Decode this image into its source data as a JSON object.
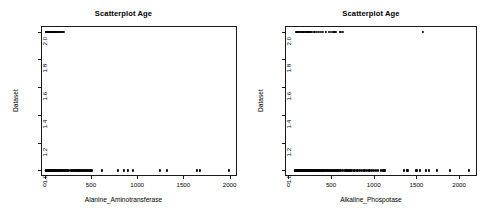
{
  "figure": {
    "background": "#ffffff",
    "point_color": "#000000",
    "axis_color": "#1a1a1a"
  },
  "chart_data": [
    {
      "type": "scatter",
      "title": "Scatterplot Age",
      "xlabel": "Alanine_Aminotransferase",
      "ylabel": "Dataset",
      "xlim": [
        -40,
        2080
      ],
      "ylim": [
        0.96,
        2.04
      ],
      "grid": false,
      "legend": "none",
      "xticks": [
        0,
        500,
        1000,
        1500,
        2000
      ],
      "xtick_labels": [
        "0",
        "500",
        "1000",
        "1500",
        "2000"
      ],
      "yticks": [
        1.0,
        1.2,
        1.4,
        1.6,
        1.8,
        2.0
      ],
      "ytick_labels": [
        "1.0",
        "1.2",
        "1.4",
        "1.6",
        "1.8",
        "2.0"
      ],
      "series": [
        {
          "name": "Dataset 2",
          "y": 2.0,
          "x": [
            10,
            14,
            16,
            18,
            20,
            22,
            24,
            26,
            28,
            30,
            32,
            34,
            36,
            38,
            40,
            42,
            45,
            48,
            50,
            52,
            55,
            58,
            60,
            62,
            65,
            68,
            70,
            72,
            75,
            78,
            80,
            85,
            90,
            95,
            100,
            105,
            110,
            118,
            125,
            132,
            140,
            150,
            160,
            172,
            185,
            200,
            212
          ]
        },
        {
          "name": "Dataset 1",
          "y": 1.0,
          "x": [
            10,
            12,
            14,
            16,
            18,
            20,
            22,
            24,
            26,
            28,
            30,
            32,
            34,
            36,
            38,
            40,
            42,
            44,
            46,
            48,
            50,
            52,
            55,
            58,
            60,
            62,
            64,
            66,
            68,
            70,
            73,
            76,
            80,
            84,
            88,
            92,
            96,
            100,
            105,
            110,
            115,
            120,
            126,
            132,
            138,
            145,
            152,
            160,
            168,
            176,
            185,
            195,
            205,
            215,
            228,
            240,
            252,
            265,
            285,
            295,
            305,
            315,
            325,
            335,
            345,
            355,
            365,
            375,
            385,
            395,
            405,
            415,
            425,
            435,
            445,
            455,
            465,
            480,
            495,
            510,
            620,
            795,
            855,
            905,
            950,
            1245,
            1325,
            1645,
            1680,
            1995
          ]
        }
      ]
    },
    {
      "type": "scatter",
      "title": "Scatterplot Age",
      "xlabel": "Alkaline_Phospotase",
      "ylabel": "Dataset",
      "xlim": [
        -40,
        2210
      ],
      "ylim": [
        0.96,
        2.04
      ],
      "grid": false,
      "legend": "none",
      "xticks": [
        0,
        500,
        1000,
        1500,
        2000
      ],
      "xtick_labels": [
        "0",
        "500",
        "1000",
        "1500",
        "2000"
      ],
      "yticks": [
        1.0,
        1.2,
        1.4,
        1.6,
        1.8,
        2.0
      ],
      "ytick_labels": [
        "1.0",
        "1.2",
        "1.4",
        "1.6",
        "1.8",
        "2.0"
      ],
      "series": [
        {
          "name": "Dataset 2",
          "y": 2.0,
          "x": [
            85,
            95,
            105,
            115,
            125,
            135,
            145,
            155,
            165,
            175,
            185,
            195,
            205,
            215,
            225,
            235,
            245,
            255,
            268,
            280,
            295,
            310,
            330,
            355,
            385,
            410,
            440,
            470,
            500,
            520,
            540,
            560,
            600,
            620,
            640,
            1580
          ]
        },
        {
          "name": "Dataset 1",
          "y": 1.0,
          "x": [
            75,
            82,
            90,
            96,
            102,
            108,
            114,
            120,
            126,
            132,
            138,
            144,
            150,
            156,
            162,
            168,
            174,
            180,
            186,
            192,
            198,
            204,
            210,
            216,
            222,
            228,
            234,
            240,
            246,
            252,
            258,
            264,
            270,
            278,
            286,
            294,
            302,
            310,
            318,
            326,
            334,
            342,
            350,
            358,
            366,
            374,
            382,
            390,
            400,
            410,
            420,
            430,
            440,
            452,
            464,
            476,
            488,
            500,
            512,
            524,
            536,
            548,
            560,
            575,
            590,
            605,
            620,
            640,
            660,
            680,
            700,
            715,
            730,
            748,
            765,
            782,
            800,
            820,
            840,
            860,
            880,
            900,
            925,
            950,
            975,
            1000,
            1025,
            1050,
            1080,
            1105,
            1125,
            1350,
            1395,
            1500,
            1540,
            1610,
            1645,
            1745,
            1890,
            2120
          ]
        }
      ]
    }
  ]
}
